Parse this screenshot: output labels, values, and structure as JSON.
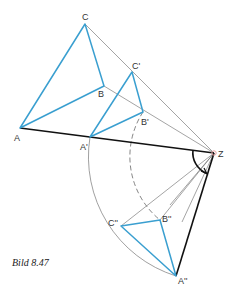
{
  "figure": {
    "caption": "Bild 8.47",
    "center_label": "Z",
    "colors": {
      "triangle": "#3a9fd0",
      "construction": "#555555",
      "axis": "#111111",
      "center_point": "#e8a0a0"
    },
    "points": {
      "A": {
        "label": "A",
        "x": 20,
        "y": 128
      },
      "B": {
        "label": "B",
        "x": 104,
        "y": 86
      },
      "C": {
        "label": "C",
        "x": 85,
        "y": 24
      },
      "A1": {
        "label": "A'",
        "x": 90,
        "y": 137
      },
      "B1": {
        "label": "B'",
        "x": 143,
        "y": 112
      },
      "C1": {
        "label": "C'",
        "x": 132,
        "y": 72
      },
      "A2": {
        "label": "A''",
        "x": 176,
        "y": 276
      },
      "B2": {
        "label": "B''",
        "x": 160,
        "y": 220
      },
      "C2": {
        "label": "C''",
        "x": 121,
        "y": 226
      },
      "Z": {
        "label": "Z",
        "x": 214,
        "y": 153
      }
    }
  }
}
